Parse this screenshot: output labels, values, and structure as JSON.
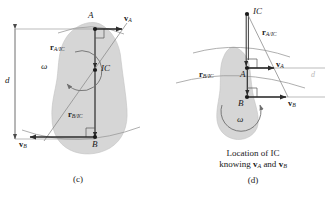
{
  "figure": {
    "background": "#ffffff",
    "body_fill": "#d6d6d6",
    "line_color": "#3a3a3a",
    "arc_color": "#9a9a9a"
  },
  "panel_c": {
    "caption": "(c)",
    "points": {
      "A": "A",
      "B": "B",
      "IC": "IC"
    },
    "vectors": {
      "vA": {
        "base": "v",
        "sub": "A",
        "direction": "right"
      },
      "vB": {
        "base": "v",
        "sub": "B",
        "direction": "left"
      }
    },
    "radii": {
      "rA": {
        "base": "r",
        "sub": "A/IC"
      },
      "rB": {
        "base": "r",
        "sub": "B/IC"
      }
    },
    "omega": "ω",
    "dimension": "d"
  },
  "panel_d": {
    "caption": "(d)",
    "caption_line1": "Location of IC",
    "caption_line2_pre": "knowing ",
    "caption_line2_vA_base": "v",
    "caption_line2_vA_sub": "A",
    "caption_line2_mid": " and ",
    "caption_line2_vB_base": "v",
    "caption_line2_vB_sub": "B",
    "points": {
      "A": "A",
      "B": "B",
      "IC": "IC"
    },
    "vectors": {
      "vA": {
        "base": "v",
        "sub": "A",
        "direction": "right"
      },
      "vB": {
        "base": "v",
        "sub": "B",
        "direction": "right"
      }
    },
    "radii": {
      "rA": {
        "base": "r",
        "sub": "A/IC"
      },
      "rB": {
        "base": "r",
        "sub": "B/IC"
      }
    },
    "omega": "ω",
    "dimension": "d"
  }
}
